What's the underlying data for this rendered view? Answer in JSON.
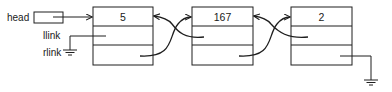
{
  "diagram": {
    "type": "doubly-linked-list",
    "labels": {
      "head": "head",
      "llink": "llink",
      "rlink": "rlink"
    },
    "nodes": [
      {
        "id": "node-1",
        "value": "5"
      },
      {
        "id": "node-2",
        "value": "167"
      },
      {
        "id": "node-3",
        "value": "2"
      }
    ],
    "edges": [
      {
        "from": "head",
        "to": "node-1"
      },
      {
        "from": "node-1.rlink",
        "to": "node-2"
      },
      {
        "from": "node-2.llink",
        "to": "node-1"
      },
      {
        "from": "node-2.rlink",
        "to": "node-3"
      },
      {
        "from": "node-3.llink",
        "to": "node-2"
      },
      {
        "from": "node-1.llink",
        "to": "null"
      },
      {
        "from": "node-3.rlink",
        "to": "null"
      }
    ],
    "colors": {
      "stroke": "#1e1e1e",
      "background": "#ffffff"
    }
  }
}
